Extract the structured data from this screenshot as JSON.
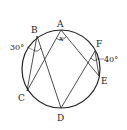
{
  "diagram": {
    "type": "inscribed-circle-geometry",
    "circle": {
      "cx": 61,
      "cy": 69,
      "r": 39
    },
    "points": {
      "A": {
        "label": "A",
        "x": 61,
        "y": 30
      },
      "B": {
        "label": "B",
        "x": 37,
        "y": 36
      },
      "C": {
        "label": "C",
        "x": 27,
        "y": 91
      },
      "D": {
        "label": "D",
        "x": 61,
        "y": 108
      },
      "E": {
        "label": "E",
        "x": 99,
        "y": 76
      },
      "F": {
        "label": "F",
        "x": 95,
        "y": 51
      }
    },
    "segments": [
      [
        "A",
        "C"
      ],
      [
        "A",
        "E"
      ],
      [
        "B",
        "C"
      ],
      [
        "B",
        "D"
      ],
      [
        "F",
        "D"
      ],
      [
        "F",
        "E"
      ]
    ],
    "angles": {
      "angle_B": {
        "label": "30°"
      },
      "angle_F": {
        "label": "40°"
      },
      "angle_A": {
        "label": "x"
      }
    },
    "colors": {
      "stroke": "#222222",
      "background": "#ffffff"
    }
  }
}
